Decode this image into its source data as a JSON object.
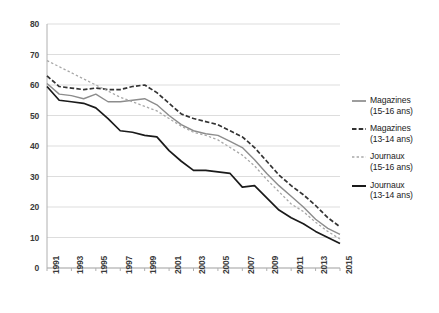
{
  "chart_data": {
    "type": "line",
    "title": "",
    "subtitle": "",
    "xlabel": "",
    "ylabel": "",
    "xlim": [
      1991,
      2015
    ],
    "ylim": [
      0,
      80
    ],
    "grid": "horizontal",
    "legend_position": "right",
    "y_ticks": [
      80,
      70,
      60,
      50,
      40,
      30,
      20,
      10,
      0
    ],
    "x_ticks": [
      "1991",
      "1993",
      "1995",
      "1997",
      "1999",
      "2001",
      "2003",
      "2005",
      "2007",
      "2009",
      "2011",
      "2013",
      "2015"
    ],
    "x": [
      1991,
      1992,
      1993,
      1994,
      1995,
      1996,
      1997,
      1998,
      1999,
      2000,
      2001,
      2002,
      2003,
      2004,
      2005,
      2006,
      2007,
      2008,
      2009,
      2010,
      2011,
      2012,
      2013,
      2014,
      2015
    ],
    "series": [
      {
        "name": "Magazines (15-16 ans)",
        "legend_label_line1": "Magazines",
        "legend_label_line2": "(15-16 ans)",
        "style": "solid",
        "color": "#8c8c8c",
        "values": [
          60.5,
          57.0,
          56.5,
          55.5,
          57.0,
          54.5,
          54.5,
          55.0,
          55.5,
          53.5,
          50.0,
          47.0,
          45.0,
          44.0,
          43.5,
          41.5,
          39.5,
          35.5,
          31.0,
          27.0,
          23.5,
          20.0,
          16.0,
          13.0,
          11.0
        ]
      },
      {
        "name": "Magazines (13-14 ans)",
        "legend_label_line1": "Magazines",
        "legend_label_line2": "(13-14 ans)",
        "style": "dashed",
        "color": "#333333",
        "values": [
          63.0,
          59.5,
          59.0,
          58.5,
          59.0,
          58.5,
          58.5,
          59.5,
          60.0,
          57.5,
          54.0,
          50.5,
          49.0,
          48.0,
          47.0,
          45.0,
          43.0,
          39.5,
          35.0,
          30.5,
          27.0,
          24.0,
          20.5,
          16.5,
          13.5
        ]
      },
      {
        "name": "Journaux (15-16 ans)",
        "legend_label_line1": "Journaux",
        "legend_label_line2": "(15-16 ans)",
        "style": "dotted",
        "color": "#a8a8a8",
        "values": [
          68.0,
          66.0,
          64.0,
          62.0,
          60.0,
          58.0,
          56.0,
          54.5,
          53.0,
          51.5,
          49.0,
          46.5,
          44.5,
          43.5,
          42.0,
          39.5,
          37.0,
          33.5,
          29.0,
          25.0,
          21.0,
          18.5,
          15.0,
          12.0,
          9.5
        ]
      },
      {
        "name": "Journaux (13-14 ans)",
        "legend_label_line1": "Journaux",
        "legend_label_line2": "(13-14 ans)",
        "style": "solid-dark",
        "color": "#1a1a1a",
        "values": [
          59.5,
          55.0,
          54.5,
          54.0,
          52.5,
          49.0,
          45.0,
          44.5,
          43.5,
          43.0,
          38.5,
          35.0,
          32.0,
          32.0,
          31.5,
          31.0,
          26.5,
          27.0,
          23.0,
          19.0,
          16.5,
          14.5,
          12.0,
          10.0,
          8.0
        ]
      }
    ]
  },
  "colors": {
    "grid": "#d9d9d9",
    "axis": "#b0b0b0",
    "tick_text": "#3a3a3a",
    "legend_text": "#1c1c1c",
    "background": "#ffffff"
  }
}
